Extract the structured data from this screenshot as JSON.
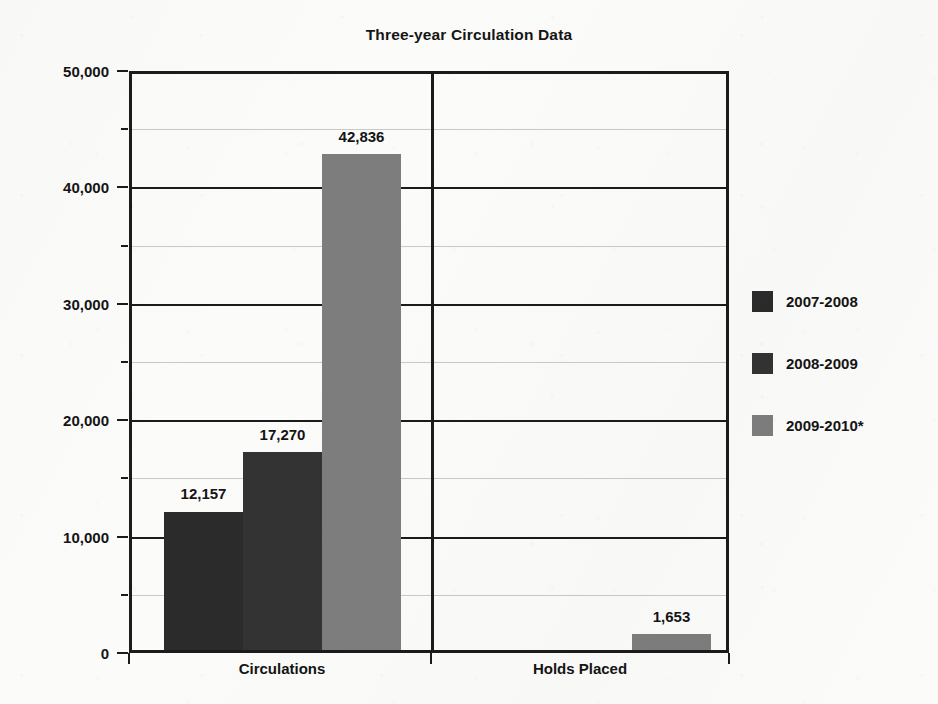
{
  "chart_data": {
    "type": "bar",
    "title": "Three-year Circulation Data",
    "xlabel": "",
    "ylabel": "",
    "categories": [
      "Circulations",
      "Holds Placed"
    ],
    "series": [
      {
        "name": "2007-2008",
        "color": "#2b2b2b",
        "values": [
          12157,
          null
        ]
      },
      {
        "name": "2008-2009",
        "color": "#333333",
        "values": [
          17270,
          null
        ]
      },
      {
        "name": "2009-2010*",
        "color": "#7d7d7d",
        "values": [
          42836,
          1653
        ]
      }
    ],
    "value_labels": {
      "circulations": [
        "12,157",
        "17,270",
        "42,836"
      ],
      "holds_placed": [
        "1,653"
      ]
    },
    "ylim": [
      0,
      50000
    ],
    "y_major_ticks": [
      0,
      10000,
      20000,
      30000,
      40000,
      50000
    ],
    "y_major_tick_labels": [
      "0",
      "10,000",
      "20,000",
      "30,000",
      "40,000",
      "50,000"
    ],
    "y_minor_ticks": [
      5000,
      15000,
      25000,
      35000,
      45000
    ],
    "grid": "horizontal",
    "legend_position": "right"
  },
  "legend": {
    "entries": [
      {
        "label": "2007-2008",
        "color": "#2b2b2b"
      },
      {
        "label": "2008-2009",
        "color": "#333333"
      },
      {
        "label": "2009-2010*",
        "color": "#7d7d7d"
      }
    ]
  }
}
